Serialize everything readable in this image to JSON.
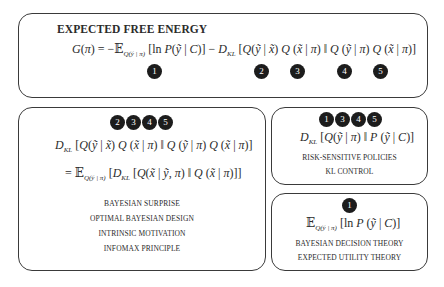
{
  "title": "EXPECTED FREE ENERGY",
  "main_equation": "G(π) = −𝔼_{Q(ỹ|π)} [ln P(ỹ | C)] − D_KL [Q(ỹ | x̃) Q(x̃ | π) ‖ Q(ỹ | π) Q(x̃ | π)]",
  "main_badges": [
    "1",
    "2",
    "3",
    "4",
    "5"
  ],
  "left_panel": {
    "badges": [
      "2",
      "3",
      "4",
      "5"
    ],
    "equation_1": "D_KL [Q(ỹ | x̃) Q(x̃ | π) ‖ Q(ỹ | π) Q(x̃ | π)]",
    "equation_2": "= 𝔼_{Q(ỹ|π)} [D_KL [Q(x̃ | ỹ, π) ‖ Q(x̃ | π)]]",
    "labels": [
      "BAYESIAN SURPRISE",
      "OPTIMAL BAYESIAN DESIGN",
      "INTRINSIC MOTIVATION",
      "INFOMAX PRINCIPLE"
    ]
  },
  "right_top_panel": {
    "badges": [
      "1",
      "3",
      "4",
      "5"
    ],
    "equation": "D_KL [Q(ỹ | π) ‖ P(ỹ | C)]",
    "labels": [
      "RISK-SENSITIVE POLICIES",
      "KL CONTROL"
    ]
  },
  "right_bottom_panel": {
    "badges": [
      "1"
    ],
    "equation": "𝔼_{Q(ỹ|π)} [ln P(ỹ | C)]",
    "labels": [
      "BAYESIAN DECISION THEORY",
      "EXPECTED UTILITY THEORY"
    ]
  }
}
